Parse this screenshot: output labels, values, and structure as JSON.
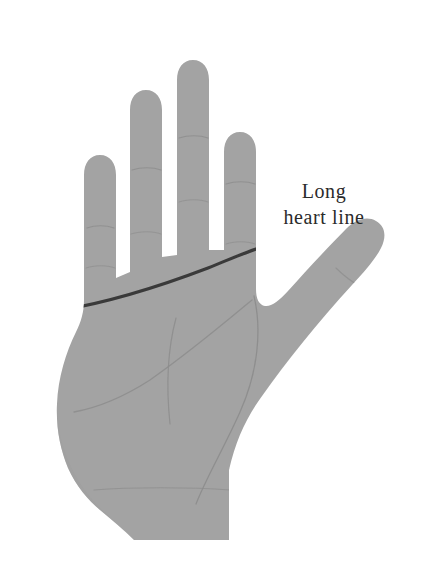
{
  "canvas": {
    "width": 434,
    "height": 571,
    "background_color": "#ffffff"
  },
  "diagram": {
    "title": "",
    "hand_fill_color": "#a3a3a3",
    "hand_shadow_color": "#9a9a9a",
    "crease_line_color": "#8b8b8b",
    "highlight_line_color": "#3a3a3a",
    "label_text_color": "#2b2b2b"
  },
  "annotations": [
    {
      "id": "heart-line",
      "line_1": "Long",
      "line_2": "heart line",
      "full_text": "Long heart line",
      "points_to": "heart-line-highlight",
      "x": 262,
      "y": 178
    }
  ],
  "palm_lines": [
    {
      "name": "heart-line",
      "emphasis": "highlighted",
      "color": "#3a3a3a",
      "stroke_width": 3.1,
      "description": "Long dark line sweeping from outer edge of palm upward to base of index finger"
    },
    {
      "name": "head-line",
      "emphasis": "normal",
      "color": "#8b8b8b",
      "stroke_width": 1.2,
      "description": "Faint line from below index finger curving down across palm"
    },
    {
      "name": "life-line",
      "emphasis": "normal",
      "color": "#8b8b8b",
      "stroke_width": 1.2,
      "description": "Faint arc curving around base of thumb"
    },
    {
      "name": "fate-line",
      "emphasis": "normal",
      "color": "#8b8b8b",
      "stroke_width": 1.2,
      "description": "Faint near-vertical line descending through middle of palm"
    },
    {
      "name": "wrist-crease",
      "emphasis": "normal",
      "color": "#8b8b8b",
      "stroke_width": 1.1,
      "description": "Horizontal crease across the wrist"
    }
  ],
  "finger_creases": [
    {
      "name": "pinky-knuckle-creases",
      "count": 2
    },
    {
      "name": "ring-knuckle-creases",
      "count": 2
    },
    {
      "name": "middle-knuckle-creases",
      "count": 2
    },
    {
      "name": "index-knuckle-creases",
      "count": 2
    },
    {
      "name": "thumb-knuckle-crease",
      "count": 1
    }
  ]
}
